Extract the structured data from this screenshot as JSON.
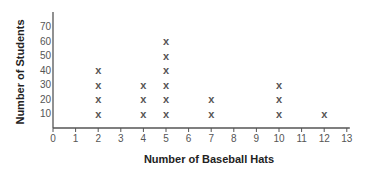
{
  "chart_data": {
    "type": "scatter",
    "subtype": "line-plot (dot plot with X marks)",
    "title": "",
    "xlabel": "Number of Baseball Hats",
    "ylabel": "Number of Students",
    "x_ticks": [
      0,
      1,
      2,
      3,
      4,
      5,
      6,
      7,
      8,
      9,
      10,
      11,
      12,
      13
    ],
    "y_ticks": [
      10,
      20,
      30,
      40,
      50,
      60,
      70
    ],
    "xlim": [
      0,
      13
    ],
    "ylim": [
      0,
      75
    ],
    "grid": false,
    "legend": null,
    "marker": "x",
    "categories": [
      2,
      4,
      5,
      7,
      10,
      12
    ],
    "values": [
      40,
      30,
      60,
      20,
      30,
      10
    ],
    "mark_counts": [
      4,
      3,
      6,
      2,
      3,
      1
    ],
    "points": [
      {
        "x": 2,
        "y": 10
      },
      {
        "x": 2,
        "y": 20
      },
      {
        "x": 2,
        "y": 30
      },
      {
        "x": 2,
        "y": 40
      },
      {
        "x": 4,
        "y": 10
      },
      {
        "x": 4,
        "y": 20
      },
      {
        "x": 4,
        "y": 30
      },
      {
        "x": 5,
        "y": 10
      },
      {
        "x": 5,
        "y": 20
      },
      {
        "x": 5,
        "y": 30
      },
      {
        "x": 5,
        "y": 40
      },
      {
        "x": 5,
        "y": 50
      },
      {
        "x": 5,
        "y": 60
      },
      {
        "x": 7,
        "y": 10
      },
      {
        "x": 7,
        "y": 20
      },
      {
        "x": 10,
        "y": 10
      },
      {
        "x": 10,
        "y": 20
      },
      {
        "x": 10,
        "y": 30
      },
      {
        "x": 12,
        "y": 10
      }
    ]
  },
  "colors": {
    "axis": "#555555",
    "marks": "#555555",
    "labels": "#222222",
    "ticks": "#555555"
  },
  "marker_glyph": "x"
}
